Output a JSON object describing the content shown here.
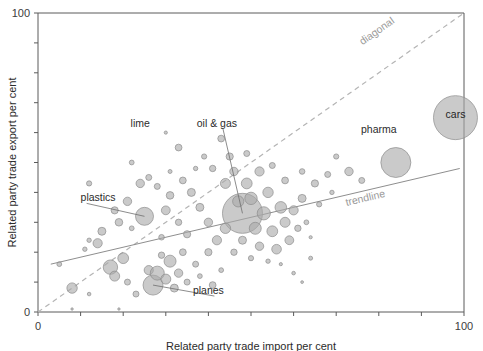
{
  "chart_data": {
    "type": "scatter",
    "title": "",
    "subtitle": "",
    "xlabel": "Related party trade import per cent",
    "ylabel": "Related party trade export per cent",
    "xlim": [
      0,
      100
    ],
    "ylim": [
      0,
      100
    ],
    "xticks": [
      0,
      10,
      20,
      30,
      40,
      50,
      60,
      70,
      80,
      90,
      100
    ],
    "yticks": [
      0,
      10,
      20,
      30,
      40,
      50,
      60,
      70,
      80,
      90,
      100
    ],
    "xtick_labels_shown": [
      "0",
      "100"
    ],
    "ytick_labels_shown": [
      "0",
      "100"
    ],
    "grid": false,
    "legend": "none",
    "bubble_size_meaning": "trade value",
    "reference_lines": [
      {
        "name": "diagonal",
        "label": "diagonal",
        "style": "dashed",
        "x0": 0,
        "y0": 0,
        "x1": 100,
        "y1": 100,
        "color": "#b4b4b4",
        "label_x": 80,
        "label_y": 93
      },
      {
        "name": "trendline",
        "label": "trendline",
        "style": "solid",
        "x0": 3,
        "y0": 16,
        "x1": 99,
        "y1": 48,
        "color": "#8e8e8e",
        "label_x": 77,
        "label_y": 37
      }
    ],
    "annotations": [
      {
        "label": "lime",
        "label_x": 24,
        "label_y": 62,
        "target_x": 30,
        "target_y": 60,
        "leader": false
      },
      {
        "label": "oil & gas",
        "label_x": 42,
        "label_y": 62,
        "target_x": 48,
        "target_y": 33,
        "leader": true
      },
      {
        "label": "plastics",
        "label_x": 10,
        "label_y": 37,
        "target_x": 25,
        "target_y": 32,
        "leader": true
      },
      {
        "label": "planes",
        "label_x": 40,
        "label_y": 6,
        "target_x": 27,
        "target_y": 9,
        "leader": true
      },
      {
        "label": "pharma",
        "label_x": 80,
        "label_y": 60,
        "target_x": 84,
        "target_y": 50,
        "leader": false
      },
      {
        "label": "cars",
        "label_x": 98,
        "label_y": 65,
        "target_x": 98,
        "target_y": 65,
        "leader": false,
        "inside_bubble": true
      }
    ],
    "points": [
      {
        "x": 98,
        "y": 65,
        "r": 22,
        "name": "cars"
      },
      {
        "x": 84,
        "y": 50,
        "r": 15,
        "name": "pharma"
      },
      {
        "x": 48,
        "y": 33,
        "r": 20,
        "name": "oil & gas"
      },
      {
        "x": 25,
        "y": 32,
        "r": 9,
        "name": "plastics"
      },
      {
        "x": 27,
        "y": 9,
        "r": 10,
        "name": "planes"
      },
      {
        "x": 30,
        "y": 60,
        "r": 1.6,
        "name": "lime"
      },
      {
        "x": 33,
        "y": 55,
        "r": 3.4,
        "name": ""
      },
      {
        "x": 22,
        "y": 50,
        "r": 2.4,
        "name": ""
      },
      {
        "x": 12,
        "y": 43,
        "r": 2.6,
        "name": ""
      },
      {
        "x": 24,
        "y": 43,
        "r": 4.2,
        "name": ""
      },
      {
        "x": 26,
        "y": 45,
        "r": 3.0,
        "name": ""
      },
      {
        "x": 21,
        "y": 37,
        "r": 4.2,
        "name": ""
      },
      {
        "x": 18,
        "y": 34,
        "r": 3.6,
        "name": ""
      },
      {
        "x": 19,
        "y": 30,
        "r": 3.8,
        "name": ""
      },
      {
        "x": 22,
        "y": 28,
        "r": 2.4,
        "name": ""
      },
      {
        "x": 30,
        "y": 34,
        "r": 4.4,
        "name": ""
      },
      {
        "x": 31,
        "y": 39,
        "r": 3.8,
        "name": ""
      },
      {
        "x": 28,
        "y": 42,
        "r": 3.0,
        "name": ""
      },
      {
        "x": 34,
        "y": 44,
        "r": 3.4,
        "name": ""
      },
      {
        "x": 36,
        "y": 40,
        "r": 4.0,
        "name": ""
      },
      {
        "x": 38,
        "y": 35,
        "r": 4.0,
        "name": ""
      },
      {
        "x": 33,
        "y": 30,
        "r": 3.2,
        "name": ""
      },
      {
        "x": 35,
        "y": 26,
        "r": 3.6,
        "name": ""
      },
      {
        "x": 29,
        "y": 25,
        "r": 2.8,
        "name": ""
      },
      {
        "x": 15,
        "y": 27,
        "r": 4.0,
        "name": ""
      },
      {
        "x": 14,
        "y": 23,
        "r": 4.6,
        "name": ""
      },
      {
        "x": 12,
        "y": 24,
        "r": 2.2,
        "name": ""
      },
      {
        "x": 11,
        "y": 21,
        "r": 2.2,
        "name": ""
      },
      {
        "x": 5,
        "y": 16,
        "r": 2.4,
        "name": ""
      },
      {
        "x": 8,
        "y": 8,
        "r": 5.2,
        "name": ""
      },
      {
        "x": 12,
        "y": 6,
        "r": 1.8,
        "name": ""
      },
      {
        "x": 17,
        "y": 15,
        "r": 7.2,
        "name": ""
      },
      {
        "x": 18,
        "y": 12,
        "r": 5.0,
        "name": ""
      },
      {
        "x": 20,
        "y": 18,
        "r": 5.4,
        "name": ""
      },
      {
        "x": 21,
        "y": 10,
        "r": 3.0,
        "name": ""
      },
      {
        "x": 23,
        "y": 6,
        "r": 3.0,
        "name": ""
      },
      {
        "x": 19,
        "y": 1,
        "r": 1.2,
        "name": ""
      },
      {
        "x": 8,
        "y": 1,
        "r": 1.2,
        "name": ""
      },
      {
        "x": 26,
        "y": 14,
        "r": 4.6,
        "name": ""
      },
      {
        "x": 28,
        "y": 13,
        "r": 7.0,
        "name": ""
      },
      {
        "x": 30,
        "y": 11,
        "r": 5.0,
        "name": ""
      },
      {
        "x": 31,
        "y": 17,
        "r": 6.0,
        "name": ""
      },
      {
        "x": 33,
        "y": 13,
        "r": 4.2,
        "name": ""
      },
      {
        "x": 32,
        "y": 8,
        "r": 4.0,
        "name": ""
      },
      {
        "x": 35,
        "y": 10,
        "r": 3.0,
        "name": ""
      },
      {
        "x": 29,
        "y": 19,
        "r": 3.2,
        "name": ""
      },
      {
        "x": 34,
        "y": 20,
        "r": 3.4,
        "name": ""
      },
      {
        "x": 37,
        "y": 16,
        "r": 3.0,
        "name": ""
      },
      {
        "x": 38,
        "y": 12,
        "r": 2.4,
        "name": ""
      },
      {
        "x": 41,
        "y": 9,
        "r": 3.4,
        "name": ""
      },
      {
        "x": 43,
        "y": 14,
        "r": 2.4,
        "name": ""
      },
      {
        "x": 40,
        "y": 20,
        "r": 3.6,
        "name": ""
      },
      {
        "x": 42,
        "y": 24,
        "r": 4.6,
        "name": ""
      },
      {
        "x": 44,
        "y": 28,
        "r": 5.2,
        "name": ""
      },
      {
        "x": 40,
        "y": 30,
        "r": 4.2,
        "name": ""
      },
      {
        "x": 44,
        "y": 43,
        "r": 5.0,
        "name": ""
      },
      {
        "x": 41,
        "y": 48,
        "r": 3.2,
        "name": ""
      },
      {
        "x": 46,
        "y": 47,
        "r": 4.2,
        "name": ""
      },
      {
        "x": 49,
        "y": 43,
        "r": 5.4,
        "name": ""
      },
      {
        "x": 52,
        "y": 47,
        "r": 4.6,
        "name": ""
      },
      {
        "x": 50,
        "y": 38,
        "r": 6.2,
        "name": ""
      },
      {
        "x": 54,
        "y": 40,
        "r": 5.2,
        "name": ""
      },
      {
        "x": 47,
        "y": 37,
        "r": 5.6,
        "name": ""
      },
      {
        "x": 53,
        "y": 33,
        "r": 6.6,
        "name": ""
      },
      {
        "x": 57,
        "y": 35,
        "r": 5.8,
        "name": ""
      },
      {
        "x": 51,
        "y": 28,
        "r": 6.0,
        "name": ""
      },
      {
        "x": 55,
        "y": 27,
        "r": 5.4,
        "name": ""
      },
      {
        "x": 58,
        "y": 30,
        "r": 5.0,
        "name": ""
      },
      {
        "x": 60,
        "y": 34,
        "r": 4.6,
        "name": ""
      },
      {
        "x": 62,
        "y": 38,
        "r": 4.0,
        "name": ""
      },
      {
        "x": 59,
        "y": 24,
        "r": 4.4,
        "name": ""
      },
      {
        "x": 56,
        "y": 21,
        "r": 4.8,
        "name": ""
      },
      {
        "x": 52,
        "y": 22,
        "r": 4.2,
        "name": ""
      },
      {
        "x": 48,
        "y": 24,
        "r": 4.0,
        "name": ""
      },
      {
        "x": 46,
        "y": 20,
        "r": 3.2,
        "name": ""
      },
      {
        "x": 50,
        "y": 18,
        "r": 2.6,
        "name": ""
      },
      {
        "x": 54,
        "y": 17,
        "r": 2.2,
        "name": ""
      },
      {
        "x": 57,
        "y": 16,
        "r": 1.6,
        "name": ""
      },
      {
        "x": 61,
        "y": 28,
        "r": 3.2,
        "name": ""
      },
      {
        "x": 63,
        "y": 30,
        "r": 2.4,
        "name": ""
      },
      {
        "x": 64,
        "y": 25,
        "r": 1.6,
        "name": ""
      },
      {
        "x": 65,
        "y": 43,
        "r": 3.6,
        "name": ""
      },
      {
        "x": 68,
        "y": 46,
        "r": 3.0,
        "name": ""
      },
      {
        "x": 62,
        "y": 47,
        "r": 2.8,
        "name": ""
      },
      {
        "x": 58,
        "y": 44,
        "r": 3.4,
        "name": ""
      },
      {
        "x": 55,
        "y": 49,
        "r": 3.0,
        "name": ""
      },
      {
        "x": 45,
        "y": 52,
        "r": 3.6,
        "name": ""
      },
      {
        "x": 49,
        "y": 53,
        "r": 3.0,
        "name": ""
      },
      {
        "x": 39,
        "y": 52,
        "r": 2.6,
        "name": ""
      },
      {
        "x": 37,
        "y": 48,
        "r": 2.2,
        "name": ""
      },
      {
        "x": 31,
        "y": 47,
        "r": 2.0,
        "name": ""
      },
      {
        "x": 43,
        "y": 58,
        "r": 3.4,
        "name": ""
      },
      {
        "x": 73,
        "y": 47,
        "r": 4.2,
        "name": ""
      },
      {
        "x": 76,
        "y": 44,
        "r": 3.0,
        "name": ""
      },
      {
        "x": 70,
        "y": 52,
        "r": 2.6,
        "name": ""
      },
      {
        "x": 66,
        "y": 36,
        "r": 2.6,
        "name": ""
      },
      {
        "x": 69,
        "y": 40,
        "r": 2.2,
        "name": ""
      },
      {
        "x": 64,
        "y": 18,
        "r": 2.0,
        "name": ""
      },
      {
        "x": 60,
        "y": 13,
        "r": 1.8,
        "name": ""
      },
      {
        "x": 62,
        "y": 10,
        "r": 1.4,
        "name": ""
      }
    ]
  }
}
